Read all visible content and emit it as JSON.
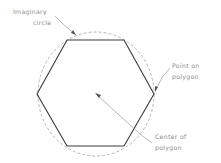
{
  "diagram": {
    "labels": {
      "imaginary_circle_line1": "Imaginary",
      "imaginary_circle_line2": "circle",
      "point_line1": "Point on",
      "point_line2": "polygon",
      "center_line1": "Center of",
      "center_line2": "polygon"
    },
    "shape": {
      "polygon_sides": 6,
      "circle_style": "dashed"
    },
    "colors": {
      "polygon": "#3a3a3a",
      "circle": "#9a9a9a",
      "leader": "#8a8a8a",
      "text": "#8a8a8a"
    }
  }
}
